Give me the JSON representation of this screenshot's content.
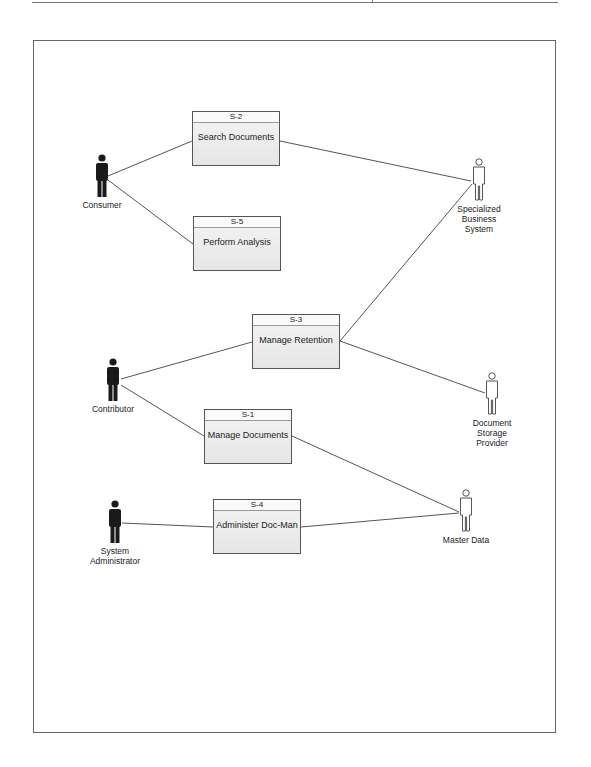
{
  "diagram": {
    "type": "use-case",
    "colors": {
      "line": "#555555",
      "box_border": "#555555",
      "box_fill": "#ececec",
      "primary_actor_fill": "#1a1a1a",
      "secondary_actor_fill": "#ffffff"
    },
    "use_cases": [
      {
        "id": "S-2",
        "name": "Search Documents"
      },
      {
        "id": "S-5",
        "name": "Perform Analysis"
      },
      {
        "id": "S-3",
        "name": "Manage Retention"
      },
      {
        "id": "S-1",
        "name": "Manage Documents"
      },
      {
        "id": "S-4",
        "name": "Administer Doc-Man"
      }
    ],
    "actors": {
      "primary": [
        {
          "name": "Consumer"
        },
        {
          "name": "Contributor"
        },
        {
          "name": "System Administrator",
          "lines": [
            "System",
            "Administrator"
          ]
        }
      ],
      "secondary": [
        {
          "name": "Specialized Business System",
          "lines": [
            "Specialized",
            "Business",
            "System"
          ]
        },
        {
          "name": "Document Storage Provider",
          "lines": [
            "Document",
            "Storage",
            "Provider"
          ]
        },
        {
          "name": "Master Data"
        }
      ]
    },
    "associations": [
      [
        "Consumer",
        "S-2"
      ],
      [
        "Consumer",
        "S-5"
      ],
      [
        "S-2",
        "Specialized Business System"
      ],
      [
        "Contributor",
        "S-3"
      ],
      [
        "Contributor",
        "S-1"
      ],
      [
        "S-3",
        "Specialized Business System"
      ],
      [
        "S-3",
        "Document Storage Provider"
      ],
      [
        "S-1",
        "Master Data"
      ],
      [
        "System Administrator",
        "S-4"
      ],
      [
        "S-4",
        "Master Data"
      ]
    ]
  }
}
